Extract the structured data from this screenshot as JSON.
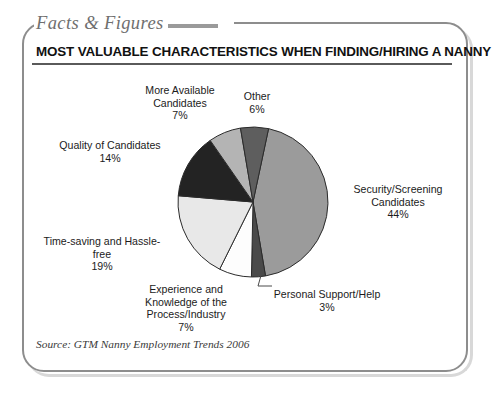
{
  "panel": {
    "tab_label": "Facts & Figures",
    "title": "MOST VALUABLE CHARACTERISTICS WHEN FINDING/HIRING A NANNY",
    "source": "Source: GTM Nanny Employment Trends 2006"
  },
  "labels": {
    "more_available": "More Available\nCandidates\n7%",
    "other": "Other\n6%",
    "quality": "Quality of Candidates\n14%",
    "time_saving": "Time-saving and Hassle-\nfree\n19%",
    "experience": "Experience and\nKnowledge of the\nProcess/Industry\n7%",
    "personal_support": "Personal Support/Help\n3%",
    "security": "Security/Screening\nCandidates\n44%"
  },
  "chart_data": {
    "type": "pie",
    "title": "MOST VALUABLE CHARACTERISTICS WHEN FINDING/HIRING A NANNY",
    "source": "Source: GTM Nanny Employment Trends 2006",
    "unit": "percent",
    "total": 100,
    "legend": "none (direct callout labels)",
    "start_angle_deg_from_top_clockwise": 12,
    "direction": "clockwise",
    "categories": [
      "Security/Screening Candidates",
      "Personal Support/Help",
      "Experience and Knowledge of the Process/Industry",
      "Time-saving and Hassle-free",
      "Quality of Candidates",
      "More Available Candidates",
      "Other"
    ],
    "values": [
      44,
      3,
      7,
      19,
      14,
      7,
      6
    ],
    "slices": [
      {
        "label": "Security/Screening Candidates",
        "value": 44,
        "display": "44%",
        "color": "#9b9b9b"
      },
      {
        "label": "Personal Support/Help",
        "value": 3,
        "display": "3%",
        "color": "#4a4a4a"
      },
      {
        "label": "Experience and Knowledge of the Process/Industry",
        "value": 7,
        "display": "7%",
        "color": "#fdfdfd"
      },
      {
        "label": "Time-saving and Hassle-free",
        "value": 19,
        "display": "19%",
        "color": "#e8e8e8"
      },
      {
        "label": "Quality of Candidates",
        "value": 14,
        "display": "14%",
        "color": "#232323"
      },
      {
        "label": "More Available Candidates",
        "value": 7,
        "display": "7%",
        "color": "#b4b4b4"
      },
      {
        "label": "Other",
        "value": 6,
        "display": "6%",
        "color": "#5e5e5e"
      }
    ]
  },
  "colors": {
    "frame": "#8d8d8d",
    "tab_text": "#6f6f6f",
    "title_text": "#111111",
    "label_text": "#1b1b1b",
    "slice_outline": "#2b2b2b"
  }
}
